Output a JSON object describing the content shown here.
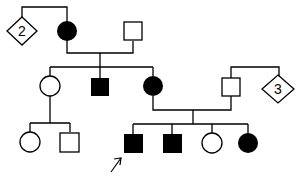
{
  "colors": {
    "affected": "#000000",
    "unaffected": "#ffffff",
    "line": "#000000"
  },
  "individuals": [
    {
      "id": "g1-diamond",
      "generation": 1,
      "sex": "unknown",
      "affected": false,
      "count_label": "2"
    },
    {
      "id": "g1-female",
      "generation": 1,
      "sex": "female",
      "affected": true
    },
    {
      "id": "g1-male",
      "generation": 1,
      "sex": "male",
      "affected": false
    },
    {
      "id": "g2-female-1",
      "generation": 2,
      "sex": "female",
      "affected": false
    },
    {
      "id": "g2-male-1",
      "generation": 2,
      "sex": "male",
      "affected": true
    },
    {
      "id": "g2-female-2",
      "generation": 2,
      "sex": "female",
      "affected": true
    },
    {
      "id": "g2-male-2",
      "generation": 2,
      "sex": "male",
      "affected": false
    },
    {
      "id": "g2-diamond",
      "generation": 2,
      "sex": "unknown",
      "affected": false,
      "count_label": "3"
    },
    {
      "id": "g3-female-1",
      "generation": 3,
      "sex": "female",
      "affected": false
    },
    {
      "id": "g3-male-1",
      "generation": 3,
      "sex": "male",
      "affected": false
    },
    {
      "id": "g3-male-2",
      "generation": 3,
      "sex": "male",
      "affected": true,
      "proband": true
    },
    {
      "id": "g3-male-3",
      "generation": 3,
      "sex": "male",
      "affected": true
    },
    {
      "id": "g3-female-2",
      "generation": 3,
      "sex": "female",
      "affected": false
    },
    {
      "id": "g3-female-3",
      "generation": 3,
      "sex": "female",
      "affected": true
    }
  ],
  "labels": {
    "diamond_1": "2",
    "diamond_2": "3"
  }
}
